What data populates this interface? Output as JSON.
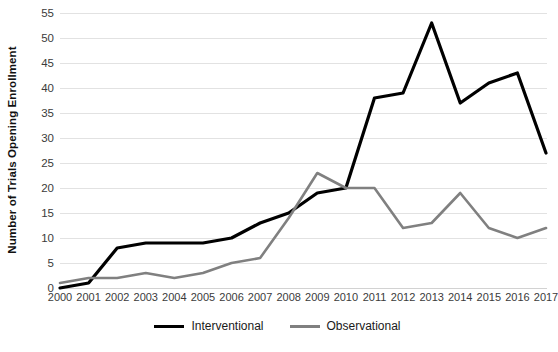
{
  "chart_data": {
    "type": "line",
    "title": "",
    "xlabel": "",
    "ylabel": "Number of Trials Opening Enrollment",
    "categories": [
      "2000",
      "2001",
      "2002",
      "2003",
      "2004",
      "2005",
      "2006",
      "2007",
      "2008",
      "2009",
      "2010",
      "2011",
      "2012",
      "2013",
      "2014",
      "2015",
      "2016",
      "2017"
    ],
    "x": [
      2000,
      2001,
      2002,
      2003,
      2004,
      2005,
      2006,
      2007,
      2008,
      2009,
      2010,
      2011,
      2012,
      2013,
      2014,
      2015,
      2016,
      2017
    ],
    "series": [
      {
        "name": "Interventional",
        "color": "#000000",
        "values": [
          0,
          1,
          8,
          9,
          9,
          9,
          10,
          13,
          15,
          19,
          20,
          38,
          39,
          53,
          37,
          41,
          43,
          27
        ]
      },
      {
        "name": "Observational",
        "color": "#808080",
        "values": [
          1,
          2,
          2,
          3,
          2,
          3,
          5,
          6,
          14,
          23,
          20,
          20,
          12,
          13,
          19,
          12,
          10,
          12
        ]
      }
    ],
    "ylim": [
      0,
      55
    ],
    "ytick_step": 5,
    "yticks": [
      0,
      5,
      10,
      15,
      20,
      25,
      30,
      35,
      40,
      45,
      50,
      55
    ],
    "ytick_labels": [
      "0",
      "5",
      "10",
      "15",
      "20",
      "25",
      "30",
      "35",
      "40",
      "45",
      "50",
      "55"
    ],
    "grid": true,
    "grid_axis": "y",
    "legend_position": "bottom"
  },
  "legend": {
    "items": [
      {
        "label": "Interventional"
      },
      {
        "label": "Observational"
      }
    ]
  },
  "colors": {
    "interventional": "#000000",
    "observational": "#808080",
    "gridline": "#e2e2e2",
    "background": "#ffffff",
    "text": "#3b3b3b"
  }
}
